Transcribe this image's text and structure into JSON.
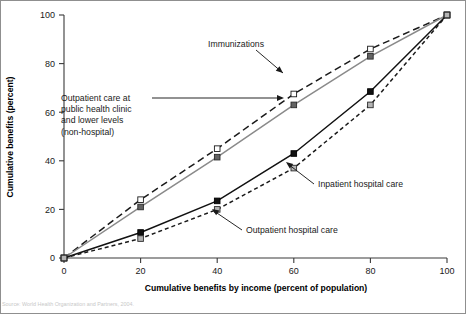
{
  "figure": {
    "background": "#ffffff",
    "frame_color": "#8f8f8f",
    "caption": "Source: World Health Organization and Partners, 2004."
  },
  "chart_data": {
    "type": "line",
    "title": "",
    "subtitle": "",
    "xlabel": "Cumulative benefits by income (percent of population)",
    "ylabel": "Cumulative benefits (percent)",
    "x": [
      0,
      20,
      40,
      60,
      80,
      100
    ],
    "xlim": [
      0,
      100
    ],
    "ylim": [
      0,
      100
    ],
    "xticks": [
      "0",
      "20",
      "40",
      "60",
      "80",
      "100"
    ],
    "yticks": [
      "0",
      "20",
      "40",
      "60",
      "80",
      "100"
    ],
    "grid": false,
    "legend_position": "inline-annotations",
    "series": [
      {
        "name": "Immunizations",
        "values": [
          0,
          24,
          45,
          67.5,
          86,
          100
        ],
        "line_style": "long-dashed",
        "line_color": "#1a1a1a",
        "marker": "square",
        "marker_fill": "#ffffff",
        "marker_edge": "#1a1a1a"
      },
      {
        "name": "Outpatient care at public health clinic and lower levels (non-hospital)",
        "values": [
          0,
          21,
          41.5,
          63,
          83,
          100
        ],
        "line_style": "solid",
        "line_color": "#8a8a8a",
        "marker": "square",
        "marker_fill": "#636363",
        "marker_edge": "#2b2b2b"
      },
      {
        "name": "Inpatient hospital care",
        "values": [
          0,
          10.5,
          23.5,
          43,
          68.5,
          100
        ],
        "line_style": "solid",
        "line_color": "#111111",
        "marker": "square",
        "marker_fill": "#111111",
        "marker_edge": "#000000"
      },
      {
        "name": "Outpatient hospital care",
        "values": [
          0,
          8,
          20,
          37,
          63,
          100
        ],
        "line_style": "short-dashed",
        "line_color": "#1a1a1a",
        "marker": "square",
        "marker_fill": "#b4b4b4",
        "marker_edge": "#2b2b2b"
      }
    ],
    "annotations": [
      {
        "id": "immunizations",
        "text": "Immunizations",
        "lines": [
          "Immunizations"
        ],
        "points_to_x": 60,
        "points_to_y": 67.5
      },
      {
        "id": "outpatient-phc",
        "text": "Outpatient care at public health clinic and lower levels (non-hospital)",
        "lines": [
          "Outpatient care at",
          "public health clinic",
          "and lower levels",
          "(non-hospital)"
        ],
        "points_to_x": 60,
        "points_to_y": 63
      },
      {
        "id": "inpatient-hospital",
        "text": "Inpatient hospital care",
        "lines": [
          "Inpatient hospital care"
        ],
        "points_to_x": 60,
        "points_to_y": 43
      },
      {
        "id": "outpatient-hospital",
        "text": "Outpatient hospital care",
        "lines": [
          "Outpatient hospital care"
        ],
        "points_to_x": 40,
        "points_to_y": 20
      }
    ]
  }
}
